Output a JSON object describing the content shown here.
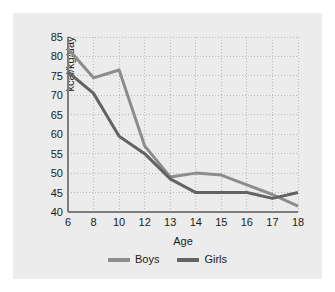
{
  "chart_data": {
    "type": "line",
    "title": "",
    "xlabel": "Age",
    "ylabel": "kcal/kg/day",
    "categories": [
      "6",
      "8",
      "10",
      "12",
      "13",
      "14",
      "15",
      "16",
      "17",
      "18"
    ],
    "x_tick_labels": [
      "6",
      "8",
      "10",
      "12",
      "13",
      "14",
      "15",
      "16",
      "17",
      "18"
    ],
    "y_tick_labels": [
      "40",
      "45",
      "50",
      "55",
      "60",
      "65",
      "70",
      "75",
      "80",
      "85"
    ],
    "y_ticks": [
      40,
      45,
      50,
      55,
      60,
      65,
      70,
      75,
      80,
      85
    ],
    "ylim": [
      40,
      85
    ],
    "grid": true,
    "grid_style": "dotted",
    "legend_position": "bottom-center",
    "series": [
      {
        "name": "Boys",
        "color": "#8c8c8c",
        "values": [
          82.0,
          74.5,
          76.5,
          57.0,
          49.0,
          50.0,
          49.5,
          47.0,
          44.5,
          41.5
        ]
      },
      {
        "name": "Girls",
        "color": "#636363",
        "values": [
          76.0,
          70.5,
          59.5,
          55.0,
          48.5,
          45.0,
          45.0,
          45.0,
          43.5,
          45.0
        ]
      }
    ]
  },
  "legend": {
    "entries": [
      {
        "label": "Boys"
      },
      {
        "label": "Girls"
      }
    ]
  },
  "colors": {
    "panel_background": "#ececec",
    "page_background": "#ffffff",
    "axis": "#7d7d7d",
    "grid": "#b9b9b9",
    "text": "#1b1b1b"
  }
}
